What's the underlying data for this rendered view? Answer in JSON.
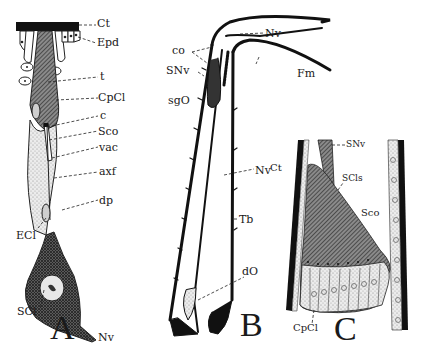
{
  "figure": {
    "panels": [
      {
        "id": "A",
        "letter": "A",
        "description": "Single chordotonal sensillum (scolopidium) from cuticle to sensory neuron",
        "labels": {
          "ct": "Ct",
          "epd": "Epd",
          "t": "t",
          "cpcl": "CpCl",
          "c": "c",
          "sco": "Sco",
          "vac": "vac",
          "axf": "axf",
          "dp": "dp",
          "ecl": "ECl",
          "scl": "SCl",
          "nv": "Nv"
        }
      },
      {
        "id": "B",
        "letter": "B",
        "description": "Leg segment (tibia) with subgenual organ and distal organ",
        "labels": {
          "co": "co",
          "snv": "SNv",
          "sgo": "sgO",
          "nv_top": "Nv",
          "fm": "Fm",
          "nv_mid": "Nv",
          "tb": "Tb",
          "do": "dO"
        }
      },
      {
        "id": "C",
        "letter": "C",
        "description": "Subgenual organ section with fan of scolopidia",
        "labels": {
          "snv": "SNv",
          "ct": "Ct",
          "scls": "SCls",
          "sco": "Sco",
          "cpcl": "CpCl"
        }
      }
    ],
    "colors": {
      "ink": "#1a1a1a",
      "background": "#ffffff",
      "stipple": "#d8d8d8"
    }
  }
}
